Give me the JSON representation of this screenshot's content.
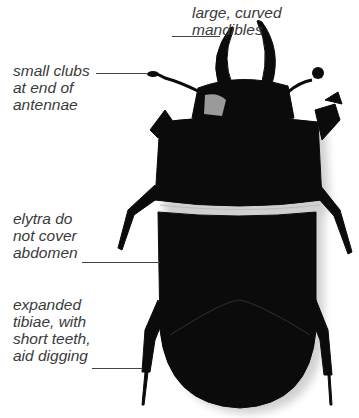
{
  "figure": {
    "colors": {
      "background": "#ffffff",
      "beetle": "#0b0b0b",
      "label_text": "#3a3a3a",
      "leader_line": "#444444"
    },
    "labels": [
      {
        "id": "mandibles",
        "text": "large, curved\nmandibles"
      },
      {
        "id": "antennae",
        "text": "small clubs\nat end of\nantennae"
      },
      {
        "id": "elytra",
        "text": "elytra do\nnot cover\nabdomen"
      },
      {
        "id": "tibiae",
        "text": "expanded\ntibiae, with\nshort teeth,\naid digging"
      }
    ]
  }
}
